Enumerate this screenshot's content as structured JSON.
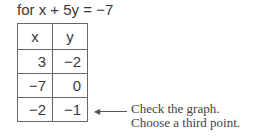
{
  "heading": "for x + 5y = −7",
  "table": {
    "headers": [
      "x",
      "y"
    ],
    "rows": [
      [
        "3",
        "−2"
      ],
      [
        "−7",
        "0"
      ],
      [
        "−2",
        "−1"
      ]
    ]
  },
  "annotation": {
    "line1": "Check the graph.",
    "line2": "Choose a third point."
  }
}
